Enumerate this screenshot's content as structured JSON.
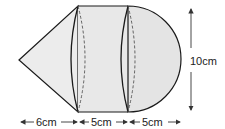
{
  "figure": {
    "type": "composite solid: cone + cylinder + hemisphere",
    "dimensions": {
      "cone_length": "6cm",
      "cylinder_length": "5cm",
      "hemisphere_length": "5cm",
      "diameter": "10cm"
    },
    "colors": {
      "fill": "#e6e6e6",
      "stroke": "#1a1a1a"
    }
  }
}
